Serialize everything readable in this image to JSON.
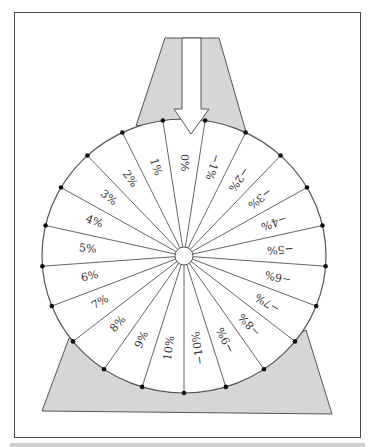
{
  "diagram": {
    "type": "prize-wheel",
    "pointer": "down-arrow",
    "segment_count": 21,
    "segments_clockwise_from_top": [
      "0%",
      "−1%",
      "−2%",
      "−3%",
      "−4%",
      "−5%",
      "−6%",
      "−7%",
      "−8%",
      "−9%",
      "−10%",
      "10%",
      "9%",
      "8%",
      "7%",
      "6%",
      "5%",
      "4%",
      "3%",
      "2%",
      "1%"
    ]
  },
  "colors": {
    "stand_fill": "#d6d6d6",
    "stroke": "#555555",
    "dot": "#111111",
    "frame": "#4a4a4a"
  }
}
